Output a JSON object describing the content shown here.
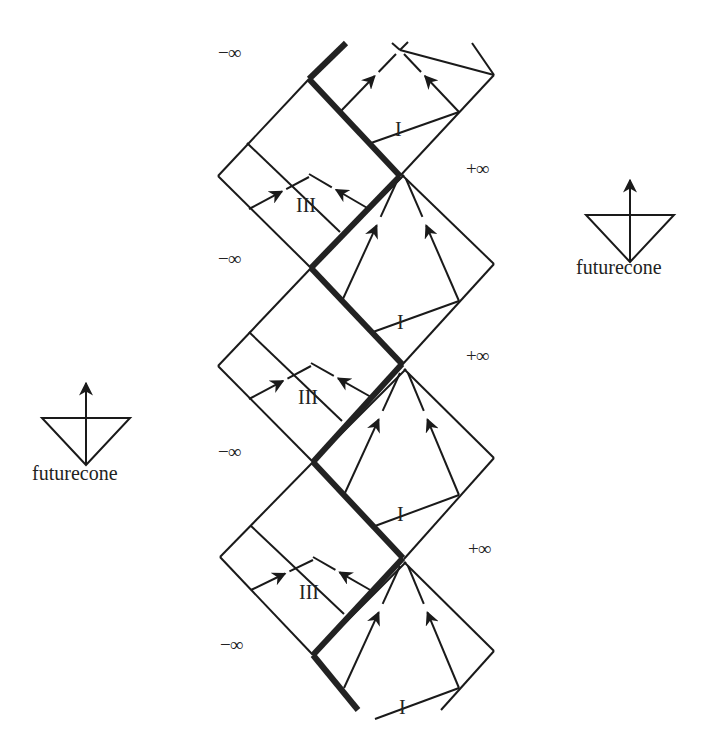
{
  "diagram": {
    "type": "penrose-diagram-strip",
    "stroke_color": "#1a1a1a",
    "thick_color": "#222222",
    "background": "#ffffff",
    "infinity_labels": [
      {
        "text": "−∞",
        "x": 218,
        "y": 54
      },
      {
        "text": "+∞",
        "x": 466,
        "y": 170
      },
      {
        "text": "−∞",
        "x": 218,
        "y": 260
      },
      {
        "text": "+∞",
        "x": 466,
        "y": 357
      },
      {
        "text": "−∞",
        "x": 218,
        "y": 453
      },
      {
        "text": "+∞",
        "x": 468,
        "y": 550
      },
      {
        "text": "−∞",
        "x": 220,
        "y": 646
      }
    ],
    "region_labels": [
      {
        "text": "I",
        "x": 400,
        "y": 130
      },
      {
        "text": "III",
        "x": 311,
        "y": 206
      },
      {
        "text": "I",
        "x": 402,
        "y": 323
      },
      {
        "text": "III",
        "x": 313,
        "y": 398
      },
      {
        "text": "I",
        "x": 402,
        "y": 515
      },
      {
        "text": "III",
        "x": 314,
        "y": 593
      },
      {
        "text": "I",
        "x": 404,
        "y": 708
      }
    ]
  },
  "legends": [
    {
      "label": "futurecone",
      "cx": 630,
      "top_y": 174,
      "label_y": 270
    },
    {
      "label": "futurecone",
      "cx": 86,
      "top_y": 377,
      "label_y": 476
    }
  ]
}
